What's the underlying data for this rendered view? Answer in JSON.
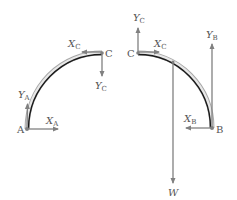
{
  "diagram": {
    "type": "free-body-diagram",
    "colors": {
      "arrow": "#808080",
      "member_outline": "#9a9a9a",
      "member_core": "#1a1a1a",
      "label": "#555555"
    },
    "left_body": {
      "name": "member-AC",
      "points": {
        "A": {
          "label": "A"
        },
        "C": {
          "label": "C"
        }
      },
      "forces": [
        {
          "id": "XA",
          "symbol": "X",
          "subscript": "A",
          "direction": "right",
          "at": "A"
        },
        {
          "id": "YA",
          "symbol": "Y",
          "subscript": "A",
          "direction": "up",
          "at": "A"
        },
        {
          "id": "XC",
          "symbol": "X",
          "subscript": "C",
          "direction": "left",
          "at": "C"
        },
        {
          "id": "YC",
          "symbol": "Y",
          "subscript": "C",
          "direction": "down",
          "at": "C"
        }
      ]
    },
    "right_body": {
      "name": "member-CB",
      "points": {
        "C": {
          "label": "C"
        },
        "B": {
          "label": "B"
        }
      },
      "forces": [
        {
          "id": "YC",
          "symbol": "Y",
          "subscript": "C",
          "direction": "up",
          "at": "C"
        },
        {
          "id": "XC",
          "symbol": "X",
          "subscript": "C",
          "direction": "right",
          "at": "C"
        },
        {
          "id": "W",
          "symbol": "W",
          "subscript": "",
          "direction": "down",
          "at": "center-of-gravity"
        },
        {
          "id": "YB",
          "symbol": "Y",
          "subscript": "B",
          "direction": "up",
          "at": "B"
        },
        {
          "id": "XB",
          "symbol": "X",
          "subscript": "B",
          "direction": "left",
          "at": "B"
        }
      ]
    }
  }
}
